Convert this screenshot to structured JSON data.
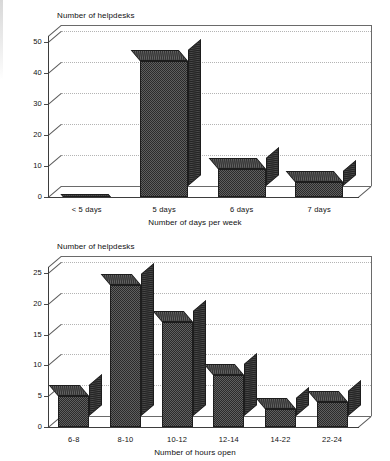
{
  "page": {
    "background": "#ffffff",
    "bar_fill": "#4f4f4f",
    "bar_outline": "#1d1d1d",
    "grid_color": "#c9c9c9",
    "axis_color": "#3d3d3d"
  },
  "chart_data": [
    {
      "type": "bar",
      "id": "days-per-week",
      "title": "",
      "ylabel": "Number of helpdesks",
      "xlabel": "Number of days per week",
      "categories": [
        "< 5 days",
        "5 days",
        "6 days",
        "7 days"
      ],
      "values": [
        0,
        44,
        9,
        5
      ],
      "yticks": [
        "0",
        "10",
        "20",
        "30",
        "40",
        "50"
      ],
      "ytick_values": [
        0,
        10,
        20,
        30,
        40,
        50
      ],
      "ylim": [
        0,
        52
      ],
      "grid": true,
      "legend": "none",
      "style": "3d-column"
    },
    {
      "type": "bar",
      "id": "hours-open",
      "title": "",
      "ylabel": "Number of helpdesks",
      "xlabel": "Number of hours open",
      "categories": [
        "6-8",
        "8-10",
        "10-12",
        "12-14",
        "14-22",
        "22-24"
      ],
      "values": [
        5,
        23,
        17,
        8.5,
        3,
        4
      ],
      "yticks": [
        "0",
        "5",
        "10",
        "15",
        "20",
        "25"
      ],
      "ytick_values": [
        0,
        5,
        10,
        15,
        20,
        25
      ],
      "ylim": [
        0,
        26
      ],
      "grid": true,
      "legend": "none",
      "style": "3d-column"
    }
  ]
}
